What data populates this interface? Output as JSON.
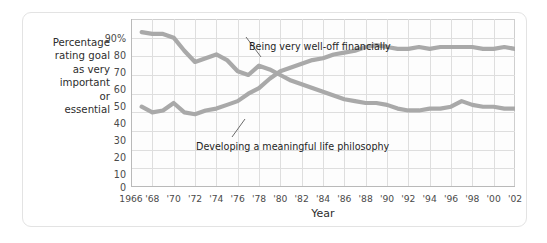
{
  "card": {
    "title": ""
  },
  "axes": {
    "y_title_lines": [
      "Percentage",
      "rating goal",
      "as very",
      "important",
      "or",
      "essential"
    ],
    "y_ticks": [
      "90%",
      "80",
      "70",
      "60",
      "50",
      "40",
      "30",
      "20",
      "10",
      "0"
    ],
    "x_title": "Year",
    "x_ticks": [
      "1966",
      "'68",
      "'70",
      "'72",
      "'74",
      "'76",
      "'78",
      "'80",
      "'82",
      "'84",
      "'86",
      "'88",
      "'90",
      "'92",
      "'94",
      "'96",
      "'98",
      "'00",
      "'02"
    ]
  },
  "annotations": {
    "welloff": "Being very well-off financially",
    "philosophy": "Developing a meaningful life philosophy"
  },
  "colors": {
    "line": "#a9a9a9",
    "grid": "#dedede",
    "axis": "#b9b9b9",
    "card_border": "#e3e3e3",
    "text": "#2d2d2d",
    "plot_bg": "#fdfdfd"
  },
  "chart_data": {
    "type": "line",
    "title": "",
    "xlabel": "Year",
    "ylabel": "Percentage rating goal as very important or essential",
    "xlim": [
      1966,
      2002
    ],
    "ylim": [
      0,
      90
    ],
    "grid": true,
    "legend": "inline-annotations",
    "x": [
      1967,
      1968,
      1969,
      1970,
      1971,
      1972,
      1973,
      1974,
      1975,
      1976,
      1977,
      1978,
      1979,
      1980,
      1981,
      1982,
      1983,
      1984,
      1985,
      1986,
      1987,
      1988,
      1989,
      1990,
      1991,
      1992,
      1993,
      1994,
      1995,
      1996,
      1997,
      1998,
      1999,
      2000,
      2001,
      2002
    ],
    "series": [
      {
        "name": "Being very well-off financially",
        "values": [
          43,
          40,
          41,
          45,
          40,
          39,
          41,
          42,
          44,
          46,
          50,
          53,
          58,
          62,
          64,
          66,
          68,
          69,
          71,
          72,
          73,
          75,
          76,
          75,
          74,
          74,
          75,
          74,
          75,
          75,
          75,
          75,
          74,
          74,
          75,
          74
        ]
      },
      {
        "name": "Developing a meaningful life philosophy",
        "values": [
          83,
          82,
          82,
          80,
          73,
          67,
          69,
          71,
          68,
          62,
          60,
          65,
          63,
          60,
          57,
          55,
          53,
          51,
          49,
          47,
          46,
          45,
          45,
          44,
          42,
          41,
          41,
          42,
          42,
          43,
          46,
          44,
          43,
          43,
          42,
          42
        ]
      }
    ]
  }
}
